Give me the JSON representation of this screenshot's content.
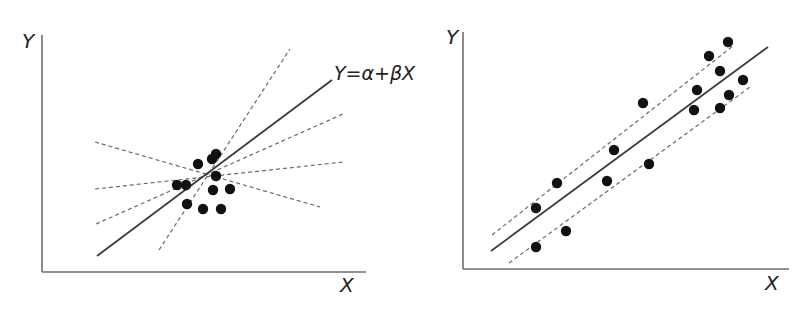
{
  "chart_data": [
    {
      "type": "scatter",
      "title": "",
      "xlabel": "X",
      "ylabel": "Y",
      "annotation": "Y=α+βX",
      "grid": false,
      "legend": null,
      "axes_px": {
        "origin": [
          42,
          272
        ],
        "x_end": 366,
        "y_end": 35
      },
      "points_px": [
        [
          177,
          185
        ],
        [
          186,
          185
        ],
        [
          198,
          164
        ],
        [
          212,
          159
        ],
        [
          216,
          154
        ],
        [
          216,
          176
        ],
        [
          213,
          190
        ],
        [
          230,
          189
        ],
        [
          187,
          204
        ],
        [
          203,
          209
        ],
        [
          221,
          209
        ]
      ],
      "fit_line_px": [
        [
          97,
          256
        ],
        [
          332,
          80
        ]
      ],
      "alternative_lines_px": [
        [
          [
            159,
            250
          ],
          [
            290,
            49
          ]
        ],
        [
          [
            96,
            224
          ],
          [
            343,
            114
          ]
        ],
        [
          [
            95,
            189
          ],
          [
            343,
            162
          ]
        ],
        [
          [
            95,
            142
          ],
          [
            320,
            207
          ]
        ]
      ]
    },
    {
      "type": "scatter",
      "title": "",
      "xlabel": "X",
      "ylabel": "Y",
      "grid": false,
      "legend": null,
      "axes_px": {
        "origin": [
          463,
          269
        ],
        "x_end": 789,
        "y_end": 32
      },
      "points_px": [
        [
          536,
          208
        ],
        [
          557,
          183
        ],
        [
          566,
          231
        ],
        [
          536,
          247
        ],
        [
          607,
          181
        ],
        [
          614,
          150
        ],
        [
          643,
          103
        ],
        [
          649,
          164
        ],
        [
          694,
          110
        ],
        [
          697,
          90
        ],
        [
          709,
          56
        ],
        [
          720,
          71
        ],
        [
          728,
          42
        ],
        [
          720,
          108
        ],
        [
          729,
          95
        ],
        [
          743,
          80
        ]
      ],
      "fit_line_px": [
        [
          491,
          251
        ],
        [
          768,
          47
        ]
      ],
      "confidence_lines_px": [
        [
          [
            492,
            235
          ],
          [
            733,
            46
          ]
        ],
        [
          [
            509,
            263
          ],
          [
            750,
            87
          ]
        ]
      ]
    }
  ],
  "labels": {
    "left_y": "Y",
    "left_x": "X",
    "equation": "Y=α+βX",
    "right_y": "Y",
    "right_x": "X"
  }
}
